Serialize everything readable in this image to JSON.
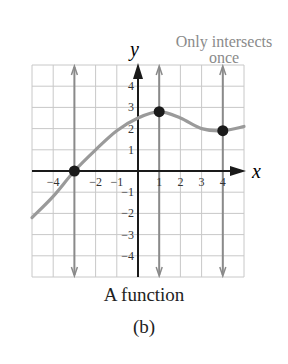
{
  "figure": {
    "annotation_line1": "Only intersects",
    "annotation_line2": "once",
    "caption_title": "A function",
    "caption_label": "(b)",
    "axis_x_label": "x",
    "axis_y_label": "y"
  },
  "colors": {
    "grid": "#c8c8c8",
    "axis": "#1a1a1a",
    "curve": "#9a9a9a",
    "vertical_lines": "#8a8a8a",
    "points": "#1a1a1a",
    "annotation": "#8a8a8a"
  },
  "chart_data": {
    "type": "line",
    "title": "A function",
    "subtitle": "(b)",
    "xlabel": "x",
    "ylabel": "y",
    "xlim": [
      -5,
      5
    ],
    "ylim": [
      -5,
      5
    ],
    "grid": true,
    "x_ticks": [
      -4,
      -2,
      -1,
      1,
      2,
      3,
      4
    ],
    "y_ticks": [
      -4,
      -3,
      -2,
      -1,
      1,
      2,
      3,
      4
    ],
    "series": [
      {
        "name": "function curve",
        "x": [
          -5,
          -4,
          -3,
          -2,
          -1,
          0,
          1,
          2,
          3,
          4,
          5
        ],
        "y": [
          -2.2,
          -1.2,
          0,
          1.0,
          1.9,
          2.5,
          2.8,
          2.5,
          2.0,
          1.9,
          2.1
        ]
      }
    ],
    "vertical_line_tests": [
      -3,
      1,
      4
    ],
    "highlighted_points": [
      {
        "x": -3,
        "y": 0
      },
      {
        "x": 1,
        "y": 2.8
      },
      {
        "x": 4,
        "y": 1.9
      }
    ],
    "annotations": [
      "Only intersects once"
    ]
  }
}
